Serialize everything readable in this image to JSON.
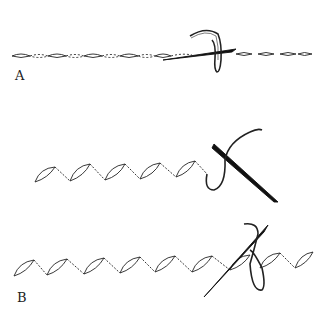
{
  "figure": {
    "panels": [
      {
        "id": "A",
        "label": "A",
        "stitch": "running stitch line with needle and looped thread"
      },
      {
        "id": "B",
        "label": "B",
        "stitch": "zig-zag stitch rows with needle and thread (two rows)"
      }
    ],
    "colors": {
      "line": "#222222",
      "background": "#ffffff"
    }
  }
}
